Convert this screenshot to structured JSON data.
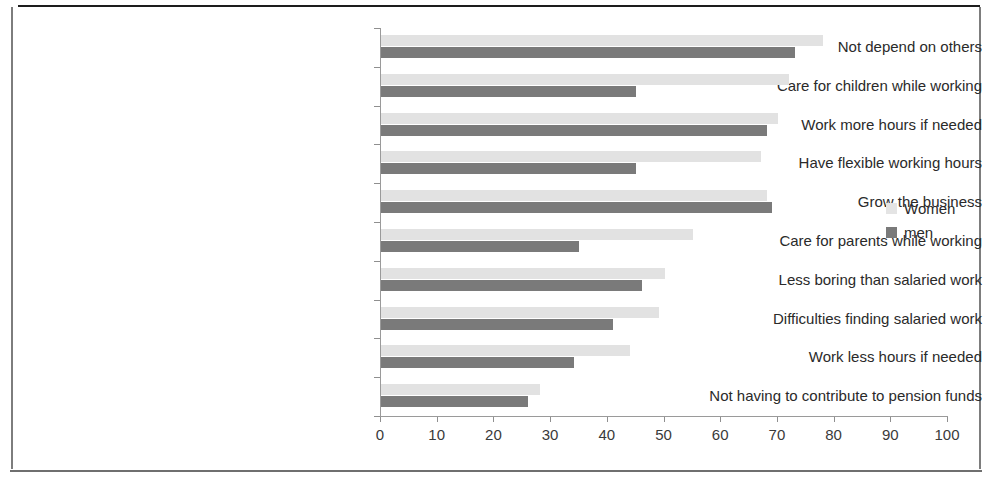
{
  "chart_data": {
    "type": "bar",
    "orientation": "horizontal",
    "title": "",
    "xlabel": "",
    "ylabel": "",
    "xlim": [
      0,
      100
    ],
    "xticks": [
      "0",
      "10",
      "20",
      "30",
      "40",
      "50",
      "60",
      "70",
      "80",
      "90",
      "100"
    ],
    "grid": false,
    "legend_position": "right",
    "categories": [
      "Not depend on others",
      "Care for children while working",
      "Work more hours if needed",
      "Have flexible working hours",
      "Grow the business",
      "Care for parents while working",
      "Less boring than salaried work",
      "Difficulties finding salaried work",
      "Work less hours if needed",
      "Not having to contribute to pension funds"
    ],
    "series": [
      {
        "name": "Women",
        "color": "#e2e2e2",
        "values": [
          78,
          72,
          70,
          67,
          68,
          55,
          50,
          49,
          44,
          28
        ]
      },
      {
        "name": "men",
        "color": "#7a7a7a",
        "values": [
          73,
          45,
          68,
          45,
          69,
          35,
          46,
          41,
          34,
          26
        ]
      }
    ]
  },
  "legend": {
    "items": [
      {
        "label": "Women",
        "swatch": "women"
      },
      {
        "label": "men",
        "swatch": "men"
      }
    ]
  }
}
